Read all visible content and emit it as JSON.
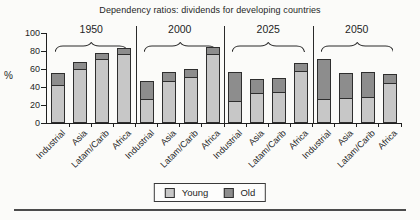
{
  "chart_data": {
    "type": "bar",
    "stacked": true,
    "title": "Dependency ratios: dividends for developing countries",
    "ylabel": "%",
    "ylim": [
      0,
      100
    ],
    "yticks": [
      0,
      20,
      40,
      60,
      80,
      100
    ],
    "grid": false,
    "legend_position": "bottom-center",
    "groups": [
      "1950",
      "2000",
      "2025",
      "2050"
    ],
    "categories": [
      "Industrial",
      "Asia",
      "Latam/Carib",
      "Africa"
    ],
    "units": "percent",
    "series": [
      {
        "name": "Young",
        "color": "#c7c7c7",
        "values": [
          [
            40,
            58,
            69,
            75
          ],
          [
            25,
            45,
            49,
            75
          ],
          [
            22,
            31,
            32,
            56
          ],
          [
            24,
            26,
            27,
            42
          ]
        ]
      },
      {
        "name": "Old",
        "color": "#8d8d8d",
        "values": [
          [
            13,
            8,
            7,
            6
          ],
          [
            20,
            10,
            9,
            7
          ],
          [
            33,
            16,
            16,
            9
          ],
          [
            45,
            27,
            27,
            10
          ]
        ]
      }
    ]
  },
  "colors": {
    "background": "#fbfbf9",
    "axis": "#1f1f1f",
    "bar_border": "#2e2e2e",
    "bottom_rule": "#4c4c4c"
  }
}
